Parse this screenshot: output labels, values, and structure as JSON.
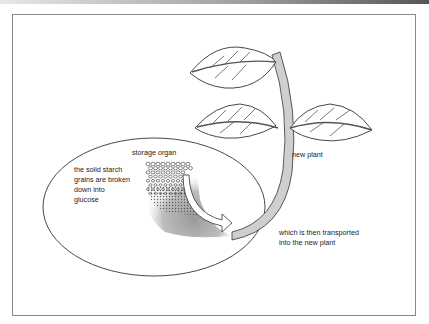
{
  "diagram": {
    "labels": {
      "storage_organ": "storage organ",
      "starch_line1": "the solid starch",
      "starch_line2": "grains are broken",
      "starch_line3": "down into",
      "starch_line4": "glucose",
      "new_plant": "new plant",
      "transport_line1": "which is then transported",
      "transport_line2": "into the new plant"
    },
    "colors": {
      "stem_fill": "#cfcfcf",
      "outline": "#333333",
      "frame": "#8a8a8a"
    }
  }
}
